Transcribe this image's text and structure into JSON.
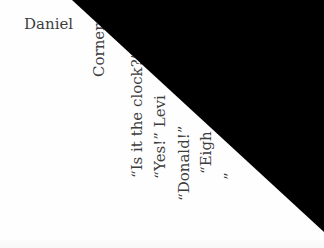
{
  "document": {
    "header_name": "Daniel",
    "lines": [
      {
        "text": "Corners"
      },
      {
        "text": "“Is it the clock?”"
      },
      {
        "text": "“Yes!”  Levi"
      },
      {
        "text": "“Donald!”"
      },
      {
        "text": "“Eigh"
      },
      {
        "text": "”"
      }
    ],
    "occluder_color": "#000000",
    "background_color": "#ffffff",
    "text_color": "#3d3d3d"
  }
}
